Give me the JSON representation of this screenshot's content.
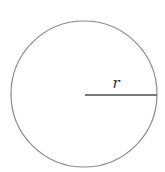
{
  "diagram": {
    "type": "circle-with-radius",
    "circle": {
      "cx": 84,
      "cy": 94,
      "r": 73,
      "stroke": "#8a8a8a",
      "stroke_width": 1.2,
      "fill": "#ffffff"
    },
    "radius_line": {
      "x1": 85,
      "y1": 95,
      "x2": 157,
      "y2": 95,
      "stroke": "#7a7a7a",
      "stroke_width": 2
    },
    "radius_label": {
      "text": "r",
      "x": 116,
      "y": 88
    }
  }
}
